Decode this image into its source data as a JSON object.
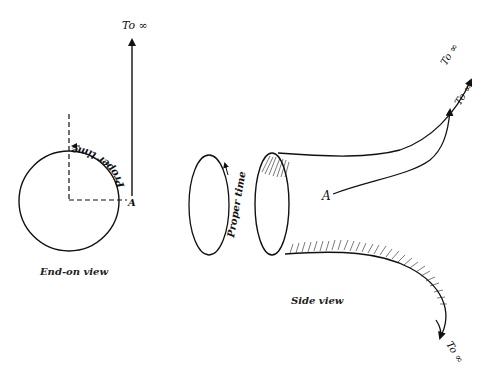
{
  "diagram": {
    "colors": {
      "ink": "#111111",
      "background": "#ffffff"
    },
    "end_on_view": {
      "caption": "End-on view",
      "arrow_label": "To ∞",
      "point_label": "A",
      "curve_label": "Proper time"
    },
    "side_view": {
      "caption": "Side view",
      "loop_label": "Proper time",
      "point_label": "A",
      "arrow_labels": [
        "To ∞",
        "To ∞",
        "To ∞"
      ]
    }
  }
}
